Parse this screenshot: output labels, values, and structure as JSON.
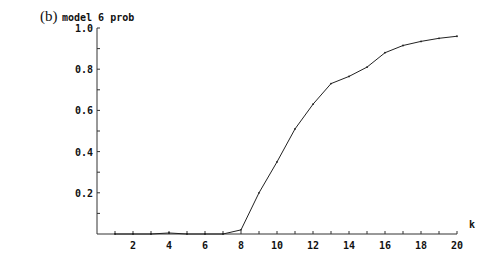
{
  "panel_label": "(b)",
  "chart_data": {
    "type": "line",
    "title": "",
    "xlabel": "k",
    "ylabel": "model 6 prob",
    "x": [
      1,
      2,
      3,
      4,
      5,
      6,
      7,
      8,
      9,
      10,
      11,
      12,
      13,
      14,
      15,
      16,
      17,
      18,
      19,
      20
    ],
    "series": [
      {
        "name": "model 6 prob",
        "values": [
          0.0,
          0.0,
          0.0,
          0.005,
          0.0,
          0.0,
          0.0,
          0.02,
          0.2,
          0.35,
          0.51,
          0.63,
          0.73,
          0.765,
          0.81,
          0.88,
          0.915,
          0.935,
          0.95,
          0.96
        ]
      }
    ],
    "xlim": [
      0,
      20
    ],
    "ylim": [
      0,
      1.0
    ],
    "xticks": [
      "2",
      "4",
      "6",
      "8",
      "10",
      "12",
      "14",
      "16",
      "18",
      "20"
    ],
    "yticks": [
      "0.2",
      "0.4",
      "0.6",
      "0.8",
      "1.0"
    ],
    "grid": false,
    "legend": null
  }
}
